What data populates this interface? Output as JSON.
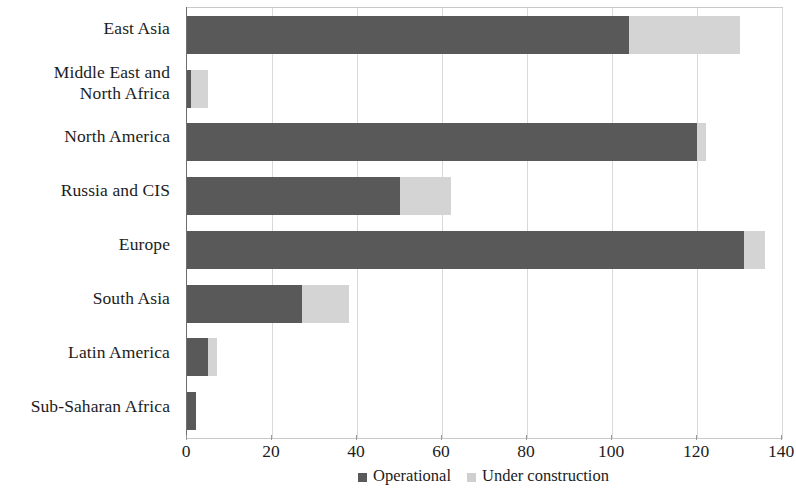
{
  "chart_data": {
    "type": "bar",
    "orientation": "horizontal",
    "stacked": true,
    "title": "",
    "subtitle": "",
    "xlabel": "",
    "ylabel": "",
    "xlim": [
      0,
      140
    ],
    "xticks": [
      0,
      20,
      40,
      60,
      80,
      100,
      120,
      140
    ],
    "grid": true,
    "grid_axis": "x",
    "legend_position": "bottom-center",
    "categories": [
      "East Asia",
      "Middle East and North Africa",
      "North America",
      "Russia and CIS",
      "Europe",
      "South Asia",
      "Latin America",
      "Sub-Saharan Africa"
    ],
    "category_label_lines": [
      [
        "East Asia"
      ],
      [
        "Middle East and",
        "North Africa"
      ],
      [
        "North America"
      ],
      [
        "Russia and CIS"
      ],
      [
        "Europe"
      ],
      [
        "South Asia"
      ],
      [
        "Latin America"
      ],
      [
        "Sub-Saharan Africa"
      ]
    ],
    "series": [
      {
        "name": "Operational",
        "color": "#595959",
        "values": [
          104,
          1,
          120,
          50,
          131,
          27,
          5,
          2
        ]
      },
      {
        "name": "Under construction",
        "color": "#d4d4d4",
        "values": [
          26,
          4,
          2,
          12,
          5,
          11,
          2,
          0
        ]
      }
    ],
    "totals": [
      130,
      5,
      122,
      62,
      136,
      38,
      7,
      2
    ]
  },
  "legend": {
    "items": [
      {
        "label": "Operational",
        "color": "#595959",
        "marker": "square-swatch-dark"
      },
      {
        "label": "Under construction",
        "color": "#d4d4d4",
        "marker": "square-swatch-light"
      }
    ]
  }
}
